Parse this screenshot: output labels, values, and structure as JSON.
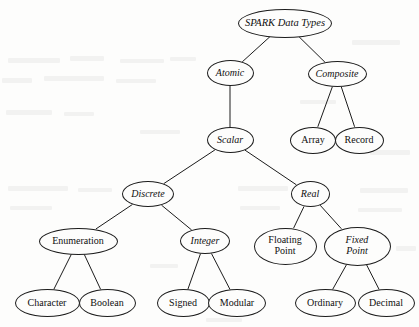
{
  "diagram": {
    "title": "SPARK Data Types",
    "type": "tree",
    "orientation": "top-down",
    "node_shape": "ellipse",
    "colors": {
      "background": "#fdfdfc",
      "stroke": "#1c1c1c",
      "text": "#101010"
    },
    "nodes": [
      {
        "id": "spark_data_types",
        "label": "SPARK Data Types",
        "style": "italic",
        "x": 285,
        "y": 23,
        "w": 94,
        "h": 29,
        "font_size": 10.5
      },
      {
        "id": "atomic",
        "label": "Atomic",
        "style": "italic",
        "x": 230,
        "y": 73,
        "w": 47,
        "h": 26,
        "font_size": 10
      },
      {
        "id": "composite",
        "label": "Composite",
        "style": "italic",
        "x": 337,
        "y": 74,
        "w": 59,
        "h": 26,
        "font_size": 10
      },
      {
        "id": "scalar",
        "label": "Scalar",
        "style": "italic",
        "x": 230,
        "y": 140,
        "w": 47,
        "h": 26,
        "font_size": 10
      },
      {
        "id": "array",
        "label": "Array",
        "style": "normal",
        "x": 313,
        "y": 140,
        "w": 46,
        "h": 27,
        "font_size": 10
      },
      {
        "id": "record",
        "label": "Record",
        "style": "normal",
        "x": 359,
        "y": 140,
        "w": 49,
        "h": 27,
        "font_size": 10
      },
      {
        "id": "discrete",
        "label": "Discrete",
        "style": "italic",
        "x": 148,
        "y": 194,
        "w": 52,
        "h": 26,
        "font_size": 10
      },
      {
        "id": "real",
        "label": "Real",
        "style": "italic",
        "x": 310,
        "y": 194,
        "w": 39,
        "h": 26,
        "font_size": 10
      },
      {
        "id": "enumeration",
        "label": "Enumeration",
        "style": "normal",
        "x": 78,
        "y": 241,
        "w": 79,
        "h": 27,
        "font_size": 10
      },
      {
        "id": "integer",
        "label": "Integer",
        "style": "italic",
        "x": 205,
        "y": 241,
        "w": 50,
        "h": 26,
        "font_size": 10
      },
      {
        "id": "floating_point",
        "label": "Floating\nPoint",
        "style": "normal",
        "x": 285,
        "y": 246,
        "w": 63,
        "h": 37,
        "font_size": 10
      },
      {
        "id": "fixed_point",
        "label": "Fixed\nPoint",
        "style": "italic",
        "x": 357,
        "y": 246,
        "w": 67,
        "h": 39,
        "font_size": 10
      },
      {
        "id": "character",
        "label": "Character",
        "style": "normal",
        "x": 47,
        "y": 303,
        "w": 65,
        "h": 28,
        "font_size": 10
      },
      {
        "id": "boolean",
        "label": "Boolean",
        "style": "normal",
        "x": 107,
        "y": 303,
        "w": 57,
        "h": 28,
        "font_size": 10
      },
      {
        "id": "signed",
        "label": "Signed",
        "style": "normal",
        "x": 183,
        "y": 303,
        "w": 53,
        "h": 28,
        "font_size": 10
      },
      {
        "id": "modular",
        "label": "Modular",
        "style": "normal",
        "x": 237,
        "y": 303,
        "w": 58,
        "h": 28,
        "font_size": 10
      },
      {
        "id": "ordinary",
        "label": "Ordinary",
        "style": "normal",
        "x": 325,
        "y": 303,
        "w": 61,
        "h": 28,
        "font_size": 10
      },
      {
        "id": "decimal",
        "label": "Decimal",
        "style": "normal",
        "x": 386,
        "y": 303,
        "w": 57,
        "h": 28,
        "font_size": 10
      }
    ],
    "edges": [
      {
        "from": "spark_data_types",
        "to": "atomic"
      },
      {
        "from": "spark_data_types",
        "to": "composite"
      },
      {
        "from": "atomic",
        "to": "scalar"
      },
      {
        "from": "composite",
        "to": "array"
      },
      {
        "from": "composite",
        "to": "record"
      },
      {
        "from": "scalar",
        "to": "discrete"
      },
      {
        "from": "scalar",
        "to": "real"
      },
      {
        "from": "discrete",
        "to": "enumeration"
      },
      {
        "from": "discrete",
        "to": "integer"
      },
      {
        "from": "real",
        "to": "floating_point"
      },
      {
        "from": "real",
        "to": "fixed_point"
      },
      {
        "from": "enumeration",
        "to": "character"
      },
      {
        "from": "enumeration",
        "to": "boolean"
      },
      {
        "from": "integer",
        "to": "signed"
      },
      {
        "from": "integer",
        "to": "modular"
      },
      {
        "from": "fixed_point",
        "to": "ordinary"
      },
      {
        "from": "fixed_point",
        "to": "decimal"
      }
    ],
    "bleed_marks": [
      {
        "x": 8,
        "y": 58,
        "w": 52,
        "h": 5
      },
      {
        "x": 70,
        "y": 56,
        "w": 34,
        "h": 5
      },
      {
        "x": 120,
        "y": 59,
        "w": 44,
        "h": 4
      },
      {
        "x": 2,
        "y": 78,
        "w": 30,
        "h": 5
      },
      {
        "x": 44,
        "y": 76,
        "w": 60,
        "h": 5
      },
      {
        "x": 116,
        "y": 79,
        "w": 40,
        "h": 4
      },
      {
        "x": 170,
        "y": 57,
        "w": 26,
        "h": 4
      },
      {
        "x": 352,
        "y": 40,
        "w": 48,
        "h": 5
      },
      {
        "x": 300,
        "y": 100,
        "w": 36,
        "h": 4
      },
      {
        "x": 6,
        "y": 110,
        "w": 46,
        "h": 5
      },
      {
        "x": 64,
        "y": 112,
        "w": 30,
        "h": 4
      },
      {
        "x": 140,
        "y": 130,
        "w": 40,
        "h": 4
      },
      {
        "x": 370,
        "y": 150,
        "w": 40,
        "h": 5
      },
      {
        "x": 8,
        "y": 186,
        "w": 60,
        "h": 5
      },
      {
        "x": 78,
        "y": 188,
        "w": 34,
        "h": 4
      },
      {
        "x": 238,
        "y": 186,
        "w": 50,
        "h": 5
      },
      {
        "x": 360,
        "y": 188,
        "w": 48,
        "h": 5
      },
      {
        "x": 10,
        "y": 206,
        "w": 42,
        "h": 4
      },
      {
        "x": 240,
        "y": 206,
        "w": 40,
        "h": 4
      },
      {
        "x": 358,
        "y": 208,
        "w": 44,
        "h": 4
      },
      {
        "x": 150,
        "y": 264,
        "w": 28,
        "h": 4
      },
      {
        "x": 396,
        "y": 246,
        "w": 20,
        "h": 5
      },
      {
        "x": 206,
        "y": 318,
        "w": 36,
        "h": 4
      }
    ]
  }
}
